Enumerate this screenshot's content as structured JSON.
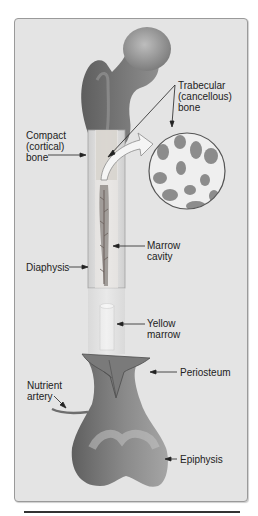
{
  "diagram": {
    "labels": {
      "trabecular": [
        "Trabecular",
        "(cancellous)",
        "bone"
      ],
      "compact": [
        "Compact",
        "(cortical)",
        "bone"
      ],
      "marrow_cavity": [
        "Marrow",
        "cavity"
      ],
      "diaphysis": "Diaphysis",
      "yellow_marrow": [
        "Yellow",
        "marrow"
      ],
      "periosteum": "Periosteum",
      "nutrient_artery": [
        "Nutrient",
        "artery"
      ],
      "epiphysis": "Epiphysis"
    },
    "colors": {
      "background": "#e4e4e4",
      "bone_dark": "#6e6e6e",
      "bone_mid": "#8a8a8a",
      "bone_light": "#c8c8c8",
      "shaft": "#d9d9d9",
      "text": "#222222"
    }
  }
}
